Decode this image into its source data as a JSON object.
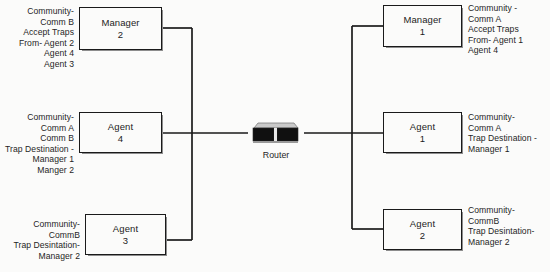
{
  "diagram": {
    "background_color": "#fbfbfa",
    "line_color": "#1a1a1a",
    "box_border_color": "#1a1a1a",
    "router": {
      "label": "Router",
      "icon": "router-device-icon",
      "body_color": "#111111",
      "top_color": "#c9c9c9"
    },
    "left_nodes": [
      {
        "id": "manager-2",
        "role": "Manager",
        "number": "2",
        "annotation": "Community-\nComm B\nAccept Traps\nFrom- Agent 2\nAgent 4\nAgent 3"
      },
      {
        "id": "agent-4",
        "role": "Agent",
        "number": "4",
        "annotation": "Community-\nComm A\nComm B\nTrap Destination -\nManager 1\nManger 2"
      },
      {
        "id": "agent-3",
        "role": "Agent",
        "number": "3",
        "annotation": "Community-\nCommB\nTrap Desintation-\nManager 2"
      }
    ],
    "right_nodes": [
      {
        "id": "manager-1",
        "role": "Manager",
        "number": "1",
        "annotation": "Community -\nComm A\nAccept Traps\nFrom- Agent 1\nAgent 4"
      },
      {
        "id": "agent-1",
        "role": "Agent",
        "number": "1",
        "annotation": "Community-\nComm A\nTrap Destination -\nManager 1"
      },
      {
        "id": "agent-2",
        "role": "Agent",
        "number": "2",
        "annotation": "Community-\nCommB\nTrap Desintation-\nManager 2"
      }
    ]
  }
}
